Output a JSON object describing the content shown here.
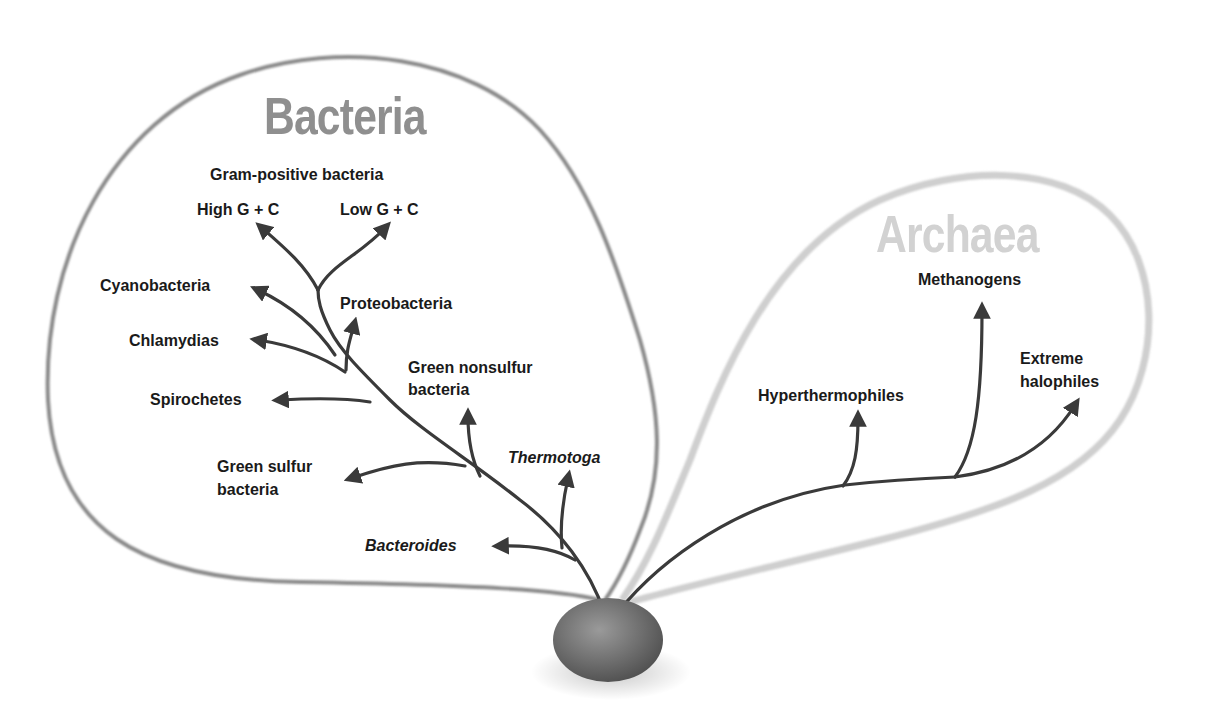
{
  "diagram": {
    "type": "phylogenetic-tree",
    "colors": {
      "bacteria_outline": "#8a8a8a",
      "archaea_outline": "#cfcfcf",
      "bacteria_title": "#8f8f8f",
      "archaea_title": "#d2d2d2",
      "branch": "#3a3a3a",
      "label": "#1a1a1a",
      "root_node": "#6e6e6e"
    },
    "bacteria": {
      "title": "Bacteria",
      "group_heading": "Gram-positive bacteria",
      "branches": {
        "high_gc": "High G + C",
        "low_gc": "Low G + C",
        "cyanobacteria": "Cyanobacteria",
        "proteobacteria": "Proteobacteria",
        "chlamydias": "Chlamydias",
        "spirochetes": "Spirochetes",
        "green_nonsulfur_1": "Green nonsulfur",
        "green_nonsulfur_2": "bacteria",
        "green_sulfur_1": "Green sulfur",
        "green_sulfur_2": "bacteria",
        "thermotoga": "Thermotoga",
        "bacteroides": "Bacteroides"
      }
    },
    "archaea": {
      "title": "Archaea",
      "branches": {
        "methanogens": "Methanogens",
        "extreme_halophiles_1": "Extreme",
        "extreme_halophiles_2": "halophiles",
        "hyperthermophiles": "Hyperthermophiles"
      }
    },
    "root": {
      "icon": "root-ancestor-node"
    }
  }
}
